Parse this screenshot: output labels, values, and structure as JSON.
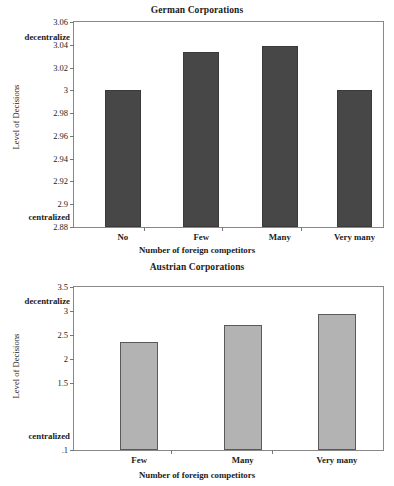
{
  "chart_data": [
    {
      "type": "bar",
      "id": "german",
      "title": "German Corporations",
      "xlabel": "Number of foreign competitors",
      "ylabel": "Level of Decisions",
      "categories": [
        "No",
        "Few",
        "Many",
        "Very many"
      ],
      "values": [
        3.0,
        3.034,
        3.039,
        3.0
      ],
      "ylim": [
        2.88,
        3.06
      ],
      "yticks": [
        "3.06",
        "3.04",
        "3.02",
        "3",
        "2.98",
        "2.96",
        "2.94",
        "2.92",
        "2.9",
        "2.88"
      ],
      "ytick_values": [
        3.06,
        3.04,
        3.02,
        3.0,
        2.98,
        2.96,
        2.94,
        2.92,
        2.9,
        2.88
      ],
      "top_note": "decentralize",
      "bottom_note": "centralized",
      "bar_color": "#474747",
      "grid": false,
      "legend": "none"
    },
    {
      "type": "bar",
      "id": "austrian",
      "title": "Austrian Corporations",
      "xlabel": "Number of foreign competitors",
      "ylabel": "Level of Decisions",
      "categories": [
        "Few",
        "Many",
        "Very many"
      ],
      "values": [
        2.35,
        2.71,
        2.93
      ],
      "ylim": [
        0.1,
        3.5
      ],
      "yticks": [
        "3.5",
        "3",
        "2.5",
        "2",
        "1.5",
        ".1"
      ],
      "ytick_values": [
        3.5,
        3.0,
        2.5,
        2.0,
        1.5,
        0.1
      ],
      "top_note": "decentralize",
      "bottom_note": "centralized",
      "bar_color": "#b3b3b3",
      "grid": false,
      "legend": "none"
    }
  ]
}
